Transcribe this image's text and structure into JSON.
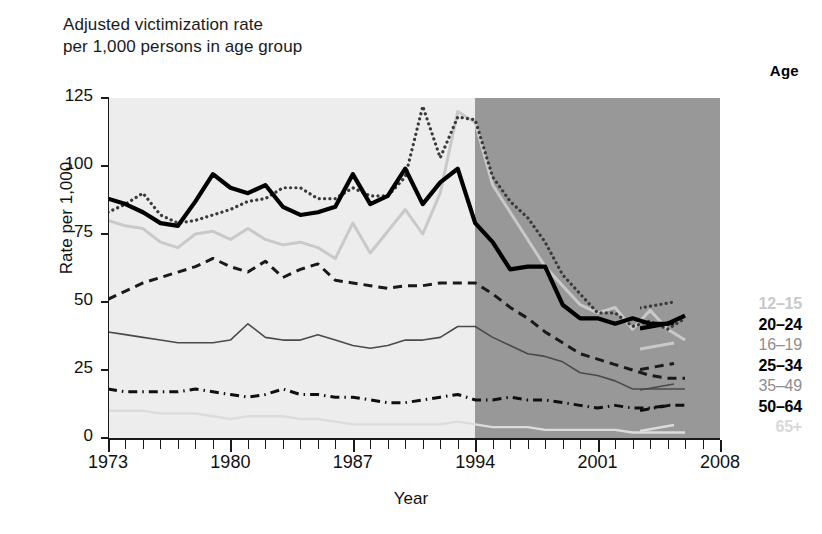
{
  "title": {
    "line1": "Adjusted victimization rate",
    "line2": "per 1,000 persons in age group"
  },
  "legend_header": "Age",
  "axes": {
    "ylabel": "Rate per 1,000",
    "xlabel": "Year",
    "yticks": [
      "0",
      "25",
      "50",
      "75",
      "100",
      "125"
    ],
    "xticks": [
      "1973",
      "1980",
      "1987",
      "1994",
      "2001",
      "2008"
    ]
  },
  "legend": [
    {
      "label": "12–15",
      "style": "g1"
    },
    {
      "label": "20–24",
      "style": "b"
    },
    {
      "label": "16–19",
      "style": "g2"
    },
    {
      "label": "25–34",
      "style": "b"
    },
    {
      "label": "35–49",
      "style": "g3"
    },
    {
      "label": "50–64",
      "style": "b"
    },
    {
      "label": "65+",
      "style": "g4"
    }
  ],
  "chart_data": {
    "type": "line",
    "title": "Adjusted victimization rate per 1,000 persons in age group",
    "xlabel": "Year",
    "ylabel": "Rate per 1,000",
    "xlim": [
      1973,
      2008
    ],
    "ylim": [
      0,
      125
    ],
    "grid": false,
    "legend_position": "right",
    "shaded_regions": [
      {
        "from": 1973,
        "to": 1994,
        "color": "#ededed"
      },
      {
        "from": 1994,
        "to": 2008,
        "color": "#989898"
      }
    ],
    "x": [
      1973,
      1974,
      1975,
      1976,
      1977,
      1978,
      1979,
      1980,
      1981,
      1982,
      1983,
      1984,
      1985,
      1986,
      1987,
      1988,
      1989,
      1990,
      1991,
      1992,
      1993,
      1994,
      1995,
      1996,
      1997,
      1998,
      1999,
      2000,
      2001,
      2002,
      2003,
      2004,
      2005,
      2006
    ],
    "series": [
      {
        "name": "12–15",
        "style": "dotted",
        "color": "#3a3a3a",
        "values": [
          83,
          86,
          90,
          82,
          79,
          80,
          82,
          84,
          87,
          88,
          92,
          92,
          88,
          88,
          92,
          89,
          89,
          96,
          122,
          103,
          118,
          117,
          96,
          87,
          81,
          72,
          60,
          53,
          46,
          46,
          41,
          43,
          40,
          44
        ]
      },
      {
        "name": "20–24",
        "style": "bold-solid",
        "color": "#000000",
        "values": [
          88,
          86,
          83,
          79,
          78,
          87,
          97,
          92,
          90,
          93,
          85,
          82,
          83,
          85,
          97,
          86,
          89,
          99,
          86,
          94,
          99,
          79,
          72,
          62,
          63,
          63,
          49,
          44,
          44,
          42,
          44,
          42,
          42,
          45
        ]
      },
      {
        "name": "16–19",
        "style": "light-solid",
        "color": "#c9c9c9",
        "values": [
          80,
          78,
          77,
          72,
          70,
          75,
          76,
          73,
          77,
          73,
          71,
          72,
          70,
          66,
          79,
          68,
          76,
          84,
          75,
          90,
          120,
          116,
          93,
          83,
          73,
          63,
          56,
          49,
          46,
          48,
          40,
          47,
          40,
          36
        ]
      },
      {
        "name": "25–34",
        "style": "dashed",
        "color": "#1a1a1a",
        "values": [
          51,
          54,
          57,
          59,
          61,
          63,
          66,
          63,
          61,
          65,
          59,
          62,
          64,
          58,
          57,
          56,
          55,
          56,
          56,
          57,
          57,
          57,
          53,
          48,
          44,
          39,
          35,
          31,
          29,
          27,
          25,
          23,
          22,
          22
        ]
      },
      {
        "name": "35–49",
        "style": "thin-solid",
        "color": "#4a4a4a",
        "values": [
          39,
          38,
          37,
          36,
          35,
          35,
          35,
          36,
          42,
          37,
          36,
          36,
          38,
          36,
          34,
          33,
          34,
          36,
          36,
          37,
          41,
          41,
          37,
          34,
          31,
          30,
          28,
          24,
          23,
          21,
          18,
          18,
          18,
          18
        ]
      },
      {
        "name": "50–64",
        "style": "dash-dot",
        "color": "#0f0f0f",
        "values": [
          18,
          17,
          17,
          17,
          17,
          18,
          17,
          16,
          15,
          16,
          18,
          16,
          16,
          15,
          15,
          14,
          13,
          13,
          14,
          15,
          16,
          14,
          14,
          15,
          14,
          14,
          13,
          12,
          11,
          12,
          11,
          11,
          12,
          12
        ]
      },
      {
        "name": "65+",
        "style": "very-light-solid",
        "color": "#dcdcdc",
        "values": [
          10,
          10,
          10,
          9,
          9,
          9,
          8,
          7,
          8,
          8,
          8,
          7,
          7,
          6,
          5,
          5,
          5,
          5,
          5,
          5,
          6,
          5,
          4,
          4,
          4,
          3,
          3,
          3,
          3,
          3,
          2,
          2,
          2,
          2
        ]
      }
    ]
  }
}
